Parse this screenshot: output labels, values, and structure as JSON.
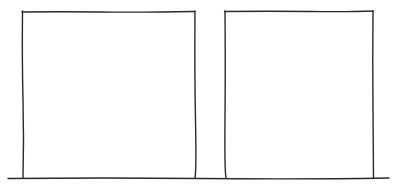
{
  "diagram": {
    "stroke_color": "#2a2a2a",
    "background": "#ffffff",
    "shapes": [
      {
        "name": "left-rectangle",
        "x": 22,
        "y": 11,
        "width": 173,
        "height": 167
      },
      {
        "name": "right-rectangle",
        "x": 225,
        "y": 11,
        "width": 148,
        "height": 167
      }
    ],
    "baseline": {
      "x1": 8,
      "x2": 389,
      "y": 178
    }
  }
}
